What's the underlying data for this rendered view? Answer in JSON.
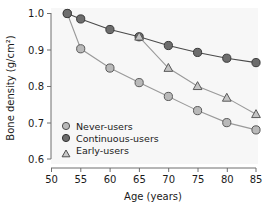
{
  "chart_data": {
    "type": "line",
    "title": "",
    "xlabel": "Age (years)",
    "ylabel": "Bone density (g/cm²)",
    "xlim": [
      50,
      85
    ],
    "ylim": [
      0.6,
      1.0
    ],
    "xticks": [
      50,
      55,
      60,
      65,
      70,
      75,
      80,
      85
    ],
    "yticks": [
      0.6,
      0.7,
      0.8,
      0.9,
      1.0
    ],
    "xtick_labels": [
      "50",
      "55",
      "60",
      "65",
      "70",
      "75",
      "80",
      "85"
    ],
    "ytick_labels": [
      "0.6",
      "0.7",
      "0.8",
      "0.9",
      "1.0"
    ],
    "grid": false,
    "legend_position": "lower-left-inside",
    "series": [
      {
        "name": "Never-users",
        "marker": "circle",
        "marker_fill": "#b9b9b9",
        "marker_edge": "#5a5a5a",
        "line_color": "#9a9a9a",
        "x": [
          52.7,
          55,
          60,
          65,
          70,
          75,
          80,
          85
        ],
        "values": [
          1.0,
          0.903,
          0.85,
          0.81,
          0.772,
          0.733,
          0.7,
          0.68
        ]
      },
      {
        "name": "Continuous-users",
        "marker": "circle",
        "marker_fill": "#6d6d6d",
        "marker_edge": "#3a3a3a",
        "line_color": "#4a4a4a",
        "x": [
          52.7,
          55,
          60,
          65,
          70,
          75,
          80,
          85
        ],
        "values": [
          1.0,
          0.985,
          0.956,
          0.936,
          0.912,
          0.893,
          0.877,
          0.865
        ]
      },
      {
        "name": "Early-users",
        "marker": "triangle",
        "marker_fill": "#c4c4c4",
        "marker_edge": "#5a5a5a",
        "line_color": "#9a9a9a",
        "x": [
          65,
          70,
          75,
          80,
          85
        ],
        "values": [
          0.936,
          0.85,
          0.8,
          0.768,
          0.723
        ]
      }
    ]
  },
  "legend": {
    "items": [
      {
        "label": "Never-users",
        "marker": "circle-light"
      },
      {
        "label": "Continuous-users",
        "marker": "circle-dark"
      },
      {
        "label": "Early-users",
        "marker": "triangle-light"
      }
    ]
  },
  "colors": {
    "plot_background": "#f7f7f7",
    "axis": "#6e6e6e",
    "text": "#1a1a1a",
    "never_users": "#b9b9b9",
    "continuous_users": "#6d6d6d",
    "early_users": "#c4c4c4"
  }
}
